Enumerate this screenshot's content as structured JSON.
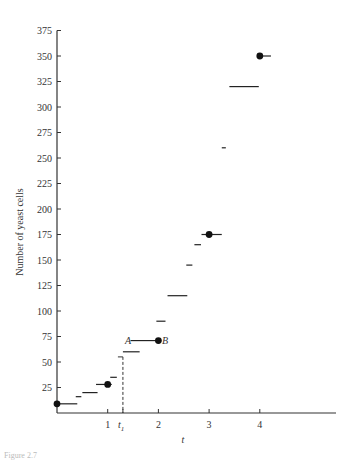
{
  "chart_data": {
    "type": "scatter",
    "title": "",
    "xlabel": "t",
    "ylabel": "Number of yeast cells",
    "xlim": [
      0,
      5.5
    ],
    "ylim": [
      0,
      375
    ],
    "x_ticks": [
      {
        "value": 1,
        "label": "1"
      },
      {
        "value": 1.3,
        "label": "t1"
      },
      {
        "value": 2,
        "label": "2"
      },
      {
        "value": 3,
        "label": "3"
      },
      {
        "value": 4,
        "label": "4"
      }
    ],
    "y_ticks": [
      25,
      50,
      75,
      100,
      125,
      150,
      175,
      200,
      225,
      250,
      275,
      300,
      325,
      350,
      375
    ],
    "grid": false,
    "legend": null,
    "points": [
      {
        "x": 0,
        "y": 9
      },
      {
        "x": 1,
        "y": 28
      },
      {
        "x": 2,
        "y": 71
      },
      {
        "x": 3,
        "y": 175
      },
      {
        "x": 4,
        "y": 350
      }
    ],
    "segments": [
      {
        "x0": 0,
        "x1": 0.4,
        "y": 9
      },
      {
        "x0": 0.37,
        "x1": 0.48,
        "y": 16
      },
      {
        "x0": 0.5,
        "x1": 0.8,
        "y": 20
      },
      {
        "x0": 0.77,
        "x1": 1.08,
        "y": 28
      },
      {
        "x0": 1.05,
        "x1": 1.18,
        "y": 35
      },
      {
        "x0": 1.3,
        "x1": 1.63,
        "y": 60
      },
      {
        "x0": 1.45,
        "x1": 1.97,
        "y": 71
      },
      {
        "x0": 1.96,
        "x1": 2.14,
        "y": 90
      },
      {
        "x0": 2.18,
        "x1": 2.57,
        "y": 115
      },
      {
        "x0": 2.55,
        "x1": 2.67,
        "y": 145
      },
      {
        "x0": 2.71,
        "x1": 2.84,
        "y": 165
      },
      {
        "x0": 2.85,
        "x1": 3.25,
        "y": 175
      },
      {
        "x0": 3.25,
        "x1": 3.33,
        "y": 260
      },
      {
        "x0": 3.4,
        "x1": 3.98,
        "y": 320
      },
      {
        "x0": 3.95,
        "x1": 4.22,
        "y": 350
      }
    ],
    "dashed_line": {
      "x": 1.3,
      "y0": 0,
      "y1": 55
    },
    "annotations": [
      {
        "text": "A",
        "x": 1.4,
        "y": 71
      },
      {
        "text": "B",
        "x": 2.1,
        "y": 71
      },
      {
        "text": "t1",
        "x": 1.3,
        "y": 0
      }
    ]
  },
  "labels": {
    "ylabel": "Number of yeast cells",
    "xlabel": "t",
    "A": "A",
    "B": "B",
    "t1_main": "t",
    "t1_sub": "1",
    "caption": "Figure 2.7"
  }
}
